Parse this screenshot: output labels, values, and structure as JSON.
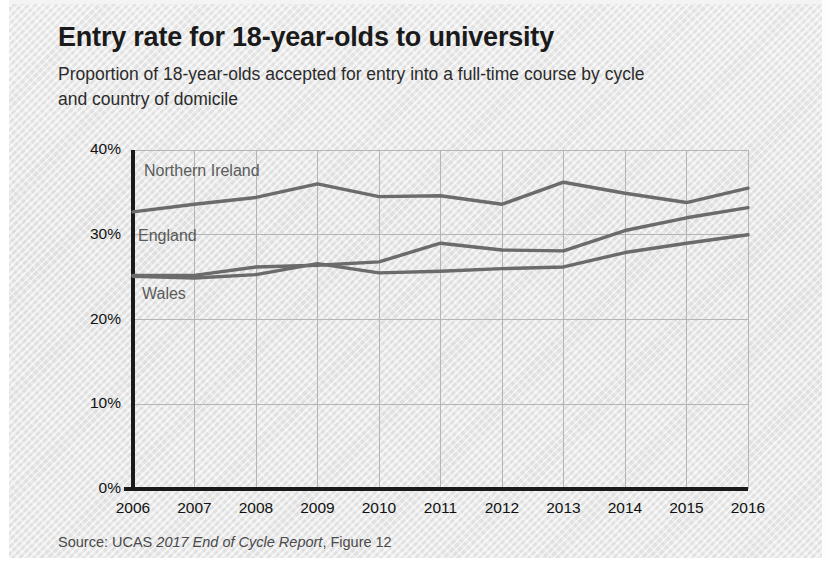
{
  "title": "Entry rate for 18-year-olds to university",
  "subtitle": "Proportion of 18-year-olds accepted for entry into a full-time course by cycle and country of domicile",
  "source": {
    "prefix": "Source: UCAS ",
    "italic": "2017 End of Cycle Report",
    "suffix": ", Figure 12"
  },
  "colors": {
    "background": "#e8e8e8",
    "title_text": "#1a1a1a",
    "body_text": "#2b2b2b",
    "axis": "#1a1a1a",
    "gridline": "#b5b5b5",
    "line_northern_ireland": "#6b6b6b",
    "line_england": "#6b6b6b",
    "line_wales": "#6b6b6b",
    "series_label": "#5b5b5b",
    "source_text": "#4a4a4a"
  },
  "chart_data": {
    "type": "line",
    "title": "Entry rate for 18-year-olds to university",
    "subtitle": "Proportion of 18-year-olds accepted for entry into a full-time course by cycle and country of domicile",
    "xlabel": "",
    "ylabel": "",
    "x": [
      2006,
      2007,
      2008,
      2009,
      2010,
      2011,
      2012,
      2013,
      2014,
      2015,
      2016
    ],
    "categories": [
      "2006",
      "2007",
      "2008",
      "2009",
      "2010",
      "2011",
      "2012",
      "2013",
      "2014",
      "2015",
      "2016"
    ],
    "xlim": [
      2006,
      2016
    ],
    "ylim": [
      0,
      40
    ],
    "yticks": [
      0,
      10,
      20,
      30,
      40
    ],
    "ytick_labels": [
      "0%",
      "10%",
      "20%",
      "30%",
      "40%"
    ],
    "grid": true,
    "legend": "inline-labels",
    "series": [
      {
        "name": "Northern Ireland",
        "label_position": "inline",
        "values": [
          32.7,
          33.6,
          34.4,
          36.0,
          34.5,
          34.6,
          33.6,
          36.2,
          34.9,
          33.8,
          35.5
        ]
      },
      {
        "name": "England",
        "label_position": "inline",
        "values": [
          25.2,
          25.2,
          26.2,
          26.4,
          26.8,
          29.0,
          28.2,
          28.1,
          30.5,
          32.0,
          33.2
        ]
      },
      {
        "name": "Wales",
        "label_position": "inline",
        "values": [
          25.1,
          24.9,
          25.3,
          26.6,
          25.5,
          25.7,
          26.0,
          26.2,
          27.9,
          29.0,
          30.0
        ]
      }
    ]
  }
}
